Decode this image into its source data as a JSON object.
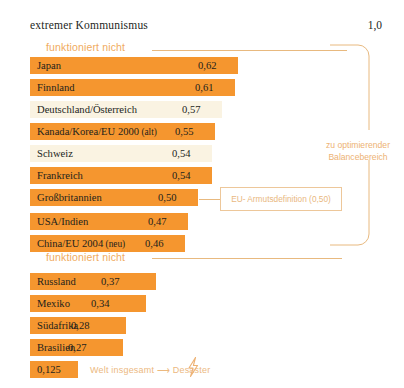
{
  "header": {
    "left_label": "extremer Kommunismus",
    "right_value": "1,0"
  },
  "captions": {
    "top": "funktioniert nicht",
    "middle": "funktioniert nicht"
  },
  "annotations": {
    "bracket_label_line1": "zu optimierender",
    "bracket_label_line2": "Balancebereich",
    "callout_label": "EU- Armutsdefinition (0,50)"
  },
  "footer": {
    "value": "0,125",
    "text": "Welt insgesamt ⟶ Desaster",
    "icon": "lightning-bolt-icon"
  },
  "colors": {
    "bar_dark": "#f5962f",
    "bar_light": "#faf3e2",
    "accent_line": "#e8b97f",
    "annotation_text": "#edb274",
    "body_text": "#231f1c"
  },
  "chart_data": {
    "type": "bar",
    "orientation": "horizontal",
    "title": "extremer Kommunismus",
    "xlabel": "",
    "ylabel": "",
    "xlim": [
      0,
      1.0
    ],
    "axis_max_label": "1,0",
    "grid": false,
    "legend": "none",
    "value_format": "comma-decimal",
    "groups": [
      {
        "caption": "funktioniert nicht",
        "categories": [
          "Japan",
          "Finnland",
          "Deutschland/Österreich",
          "Kanada/Korea/EU 2000 (alt)",
          "Schweiz",
          "Frankreich",
          "Großbritannien"
        ],
        "values": [
          0.62,
          0.61,
          0.57,
          0.55,
          0.54,
          0.54,
          0.5
        ],
        "value_labels": [
          "0,62",
          "0,61",
          "0,57",
          "0,55",
          "0,54",
          "0,54",
          "0,50"
        ]
      },
      {
        "caption": "",
        "categories": [
          "USA/Indien",
          "China/EU 2004 (neu)"
        ],
        "values": [
          0.47,
          0.46
        ],
        "value_labels": [
          "0,47",
          "0,46"
        ]
      },
      {
        "caption": "funktioniert nicht",
        "categories": [
          "Russland",
          "Mexiko",
          "Südafrika",
          "Brasilien"
        ],
        "values": [
          0.37,
          0.34,
          0.28,
          0.27
        ],
        "value_labels": [
          "0,37",
          "0,34",
          "0,28",
          "0,27"
        ]
      }
    ],
    "summary_bar": {
      "category": "Welt insgesamt",
      "value": 0.125,
      "value_label": "0,125",
      "note": "Welt insgesamt ⟶ Desaster"
    },
    "reference_line": {
      "label": "EU- Armutsdefinition (0,50)",
      "value": 0.5
    },
    "region_annotation": {
      "label": "zu optimierender Balancebereich",
      "from": 0.62,
      "to": 0.46
    },
    "rows": [
      {
        "label": "Japan",
        "value_label": "0,62",
        "style": "dark",
        "y": 57,
        "w": 208,
        "vx": 198
      },
      {
        "label": "Finnland",
        "value_label": "0,61",
        "style": "dark",
        "y": 79,
        "w": 205,
        "vx": 195
      },
      {
        "label": "Deutschland/Österreich",
        "value_label": "0,57",
        "style": "light",
        "y": 101,
        "w": 192,
        "vx": 182
      },
      {
        "label": "Kanada/Korea/EU 2000 (alt)",
        "value_label": "0,55",
        "style": "dark",
        "y": 123,
        "w": 185,
        "vx": 175,
        "small_tail": " (alt)",
        "base": "Kanada/Korea/EU 2000"
      },
      {
        "label": "Schweiz",
        "value_label": "0,54",
        "style": "light",
        "y": 145,
        "w": 182,
        "vx": 172
      },
      {
        "label": "Frankreich",
        "value_label": "0,54",
        "style": "dark",
        "y": 167,
        "w": 182,
        "vx": 172
      },
      {
        "label": "Großbritannien",
        "value_label": "0,50",
        "style": "dark",
        "y": 189,
        "w": 168,
        "vx": 158
      },
      {
        "label": "USA/Indien",
        "value_label": "0,47",
        "style": "dark",
        "y": 213,
        "w": 158,
        "vx": 148
      },
      {
        "label": "China/EU 2004 (neu)",
        "value_label": "0,46",
        "style": "dark",
        "y": 235,
        "w": 155,
        "vx": 145,
        "small_tail": " (neu)",
        "base": "China/EU 2004"
      },
      {
        "label": "Russland",
        "value_label": "0,37",
        "style": "dark",
        "y": 273,
        "w": 126,
        "vx": 101
      },
      {
        "label": "Mexiko",
        "value_label": "0,34",
        "style": "dark",
        "y": 295,
        "w": 116,
        "vx": 91
      },
      {
        "label": "Südafrika",
        "value_label": "0,28",
        "style": "dark",
        "y": 317,
        "w": 96,
        "vx": 71
      },
      {
        "label": "Brasilien",
        "value_label": "0,27",
        "style": "dark",
        "y": 339,
        "w": 93,
        "vx": 68
      }
    ]
  }
}
